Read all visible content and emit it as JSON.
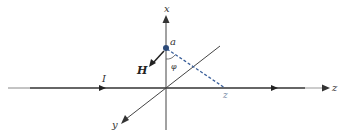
{
  "diagram": {
    "title": "",
    "axes": {
      "x_label": "x",
      "y_label": "y",
      "z_label": "z"
    },
    "point": {
      "label": "a"
    },
    "field": {
      "label": "H"
    },
    "current": {
      "label": "I"
    },
    "angle": {
      "label": "φ"
    },
    "projection": {
      "label": "z"
    },
    "colors": {
      "axis": "#333333",
      "wire": "#222222",
      "dashed": "#3a5f9a",
      "point": "#2c4a78"
    }
  }
}
